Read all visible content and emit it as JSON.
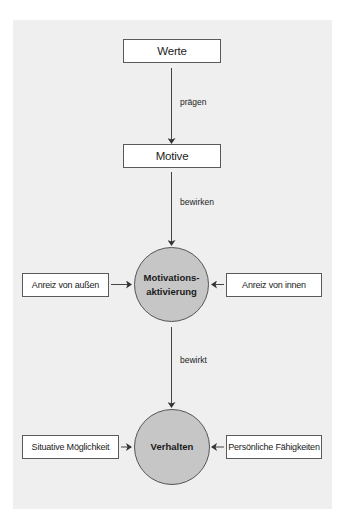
{
  "diagram": {
    "nodes": {
      "werte": "Werte",
      "motive": "Motive",
      "motivationsaktivierung_line1": "Motivations-",
      "motivationsaktivierung_line2": "aktivierung",
      "verhalten": "Verhalten",
      "anreiz_aussen": "Anreiz von außen",
      "anreiz_innen": "Anreiz von innen",
      "situative_moeglichkeit": "Situative Möglichkeit",
      "persoenliche_faehigkeiten": "Persönliche Fähigkeiten"
    },
    "edges": {
      "werte_to_motive": "prägen",
      "motive_to_motivation": "bewirken",
      "motivation_to_verhalten": "bewirkt"
    },
    "colors": {
      "panel_bg": "#efefef",
      "circle_fill": "#c6c6c6",
      "stroke": "#555555"
    }
  }
}
